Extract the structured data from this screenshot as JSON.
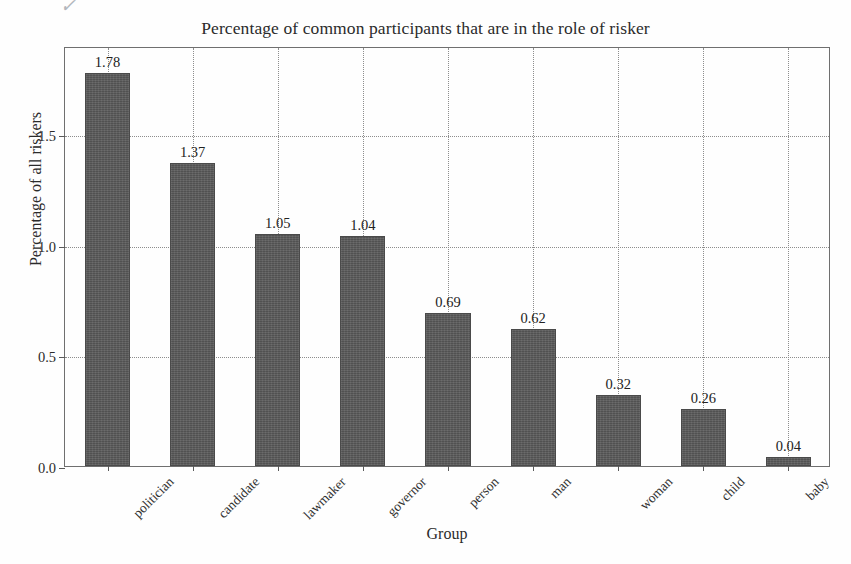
{
  "chart_data": {
    "type": "bar",
    "title": "Percentage of common participants that are in the role of risker",
    "xlabel": "Group",
    "ylabel": "Percentage of all riskers",
    "categories": [
      "politician",
      "candidate",
      "lawmaker",
      "governor",
      "person",
      "man",
      "woman",
      "child",
      "baby"
    ],
    "values": [
      1.78,
      1.37,
      1.05,
      1.04,
      0.69,
      0.62,
      0.32,
      0.26,
      0.04
    ],
    "value_labels": [
      "1.78",
      "1.37",
      "1.05",
      "1.04",
      "0.69",
      "0.62",
      "0.32",
      "0.26",
      "0.04"
    ],
    "ylim": [
      0,
      1.9
    ],
    "yticks": [
      0.0,
      0.5,
      1.0,
      1.5
    ],
    "ytick_labels": [
      "0.0",
      "0.5",
      "1.0",
      "1.5"
    ],
    "grid": true,
    "grid_style": "dotted",
    "legend": null,
    "bar_color": "#585858",
    "series": [
      {
        "name": "Percentage of all riskers",
        "values": [
          1.78,
          1.37,
          1.05,
          1.04,
          0.69,
          0.62,
          0.32,
          0.26,
          0.04
        ]
      }
    ]
  },
  "artifact": {
    "glyph": "✓"
  }
}
